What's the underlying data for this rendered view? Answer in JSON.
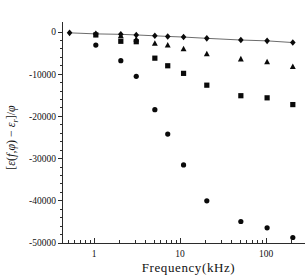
{
  "figure": {
    "background_color": "#ffffff",
    "foreground_color": "#000000",
    "marker_color": "#0a0a0a",
    "line_color": "#5b5b5b"
  },
  "chart_data": {
    "type": "scatter",
    "title": "",
    "subtitle": "",
    "xlabel": "Frequency(kHz)",
    "ylabel": "[ε(f,φ) − εᵣ]/φ",
    "ylabel_parts": {
      "open_bracket": "[",
      "eps1": "ε",
      "arg_open": "(",
      "f": "f",
      "comma": ",",
      "phi_arg": "φ",
      "arg_close": ")",
      "minus": "−",
      "eps2": "ε",
      "sub_r": "r",
      "close_bracket": "]",
      "slash": "/",
      "phi_den": "φ"
    },
    "xscale": "log",
    "yscale": "linear",
    "xlim": [
      0.5,
      250
    ],
    "ylim": [
      -50000,
      2500
    ],
    "grid": false,
    "legend": "none",
    "xticks_major": [
      1,
      10,
      100
    ],
    "xtick_labels": [
      "1",
      "10",
      "100"
    ],
    "yticks_major": [
      0,
      -10000,
      -20000,
      -30000,
      -40000,
      -50000
    ],
    "ytick_labels": [
      "0",
      "-10000",
      "-20000",
      "-30000",
      "-40000",
      "-50000"
    ],
    "ytick_minor_step": 2000,
    "series": [
      {
        "name": "diamond-series",
        "marker": "diamond",
        "connected": true,
        "points": [
          {
            "x": 0.52,
            "y": -200
          },
          {
            "x": 1.05,
            "y": -450
          },
          {
            "x": 2.05,
            "y": -550
          },
          {
            "x": 3.1,
            "y": -700
          },
          {
            "x": 5.1,
            "y": -900
          },
          {
            "x": 7.2,
            "y": -1050
          },
          {
            "x": 11.0,
            "y": -1200
          },
          {
            "x": 20.5,
            "y": -1500
          },
          {
            "x": 51.0,
            "y": -1900
          },
          {
            "x": 103.0,
            "y": -2100
          },
          {
            "x": 205.0,
            "y": -2500
          }
        ]
      },
      {
        "name": "triangle-series",
        "marker": "triangle",
        "connected": false,
        "points": [
          {
            "x": 2.05,
            "y": -900
          },
          {
            "x": 3.1,
            "y": -1700
          },
          {
            "x": 5.1,
            "y": -2700
          },
          {
            "x": 7.2,
            "y": -3100
          },
          {
            "x": 11.0,
            "y": -4000
          },
          {
            "x": 20.5,
            "y": -5200
          },
          {
            "x": 51.0,
            "y": -6400
          },
          {
            "x": 103.0,
            "y": -7100
          },
          {
            "x": 205.0,
            "y": -8200
          }
        ]
      },
      {
        "name": "square-series",
        "marker": "square",
        "connected": false,
        "points": [
          {
            "x": 1.05,
            "y": -700
          },
          {
            "x": 2.05,
            "y": -2200
          },
          {
            "x": 3.1,
            "y": -2300
          },
          {
            "x": 5.1,
            "y": -6200
          },
          {
            "x": 7.2,
            "y": -8000
          },
          {
            "x": 11.0,
            "y": -9800
          },
          {
            "x": 20.5,
            "y": -12600
          },
          {
            "x": 51.0,
            "y": -15100
          },
          {
            "x": 103.0,
            "y": -15600
          },
          {
            "x": 205.0,
            "y": -17200
          }
        ]
      },
      {
        "name": "circle-series",
        "marker": "circle",
        "connected": false,
        "points": [
          {
            "x": 1.05,
            "y": -3100
          },
          {
            "x": 2.05,
            "y": -6800
          },
          {
            "x": 3.1,
            "y": -10500
          },
          {
            "x": 5.1,
            "y": -18400
          },
          {
            "x": 7.2,
            "y": -24200
          },
          {
            "x": 11.0,
            "y": -31500
          },
          {
            "x": 20.5,
            "y": -40000
          },
          {
            "x": 51.0,
            "y": -44900
          },
          {
            "x": 103.0,
            "y": -46400
          },
          {
            "x": 205.0,
            "y": -48700
          }
        ]
      }
    ]
  }
}
